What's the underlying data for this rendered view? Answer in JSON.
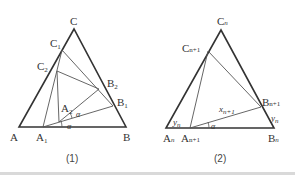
{
  "figure1": {
    "caption": "(1)",
    "vertices": {
      "A": {
        "label": "A",
        "sub": ""
      },
      "B": {
        "label": "B",
        "sub": ""
      },
      "C": {
        "label": "C",
        "sub": ""
      },
      "A1": {
        "label": "A",
        "sub": "1"
      },
      "A2": {
        "label": "A",
        "sub": "2"
      },
      "B1": {
        "label": "B",
        "sub": "1"
      },
      "B2": {
        "label": "B",
        "sub": "2"
      },
      "C1": {
        "label": "C",
        "sub": "1"
      },
      "C2": {
        "label": "C",
        "sub": "2"
      }
    },
    "angles": [
      "α",
      "α"
    ]
  },
  "figure2": {
    "caption": "(2)",
    "vertices": {
      "An": {
        "label": "A",
        "sub": "n"
      },
      "Bn": {
        "label": "B",
        "sub": "n"
      },
      "Cn": {
        "label": "C",
        "sub": "n"
      },
      "An1": {
        "label": "A",
        "sub": "n+1"
      },
      "Bn1": {
        "label": "B",
        "sub": "n+1"
      },
      "Cn1": {
        "label": "C",
        "sub": "n+1"
      }
    },
    "segment_labels": {
      "x": {
        "label": "x",
        "sub": "n+1"
      },
      "y_left": {
        "label": "y",
        "sub": "n"
      },
      "y_right": {
        "label": "y",
        "sub": "n"
      }
    },
    "angles": [
      "α"
    ]
  }
}
